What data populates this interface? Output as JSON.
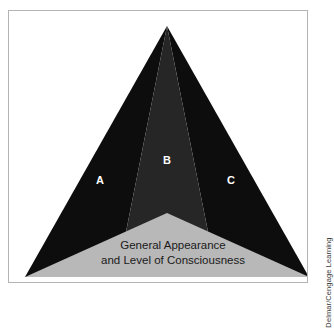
{
  "figure": {
    "type": "layered-triangle-diagram",
    "border_color": "#b3b3b3",
    "background_color": "#ffffff"
  },
  "triangle": {
    "apex": {
      "x": 158,
      "y": 15
    },
    "base_left": {
      "x": 16,
      "y": 266
    },
    "base_right": {
      "x": 300,
      "y": 266
    },
    "sections": [
      {
        "id": "A",
        "label": "A",
        "color": "#0d0d0d",
        "label_x": 91,
        "label_y": 170,
        "position": "left"
      },
      {
        "id": "B",
        "label": "B",
        "color": "#262626",
        "label_x": 158,
        "label_y": 150,
        "position": "center"
      },
      {
        "id": "C",
        "label": "C",
        "color": "#0d0d0d",
        "label_x": 222,
        "label_y": 170,
        "position": "right"
      }
    ]
  },
  "base_band": {
    "color": "#b8b8b8",
    "apex": {
      "x": 158,
      "y": 202
    },
    "left": {
      "x": 16,
      "y": 266
    },
    "right": {
      "x": 300,
      "y": 266
    },
    "lines": [
      "General Appearance",
      "and Level of Consciousness"
    ],
    "line1_x": 164,
    "line1_y": 235,
    "line2_x": 164,
    "line2_y": 250
  },
  "attribution": {
    "text": "Delmar/Cengage Learning",
    "color": "#3a3a3a",
    "orientation": "vertical-bottom-to-top"
  }
}
